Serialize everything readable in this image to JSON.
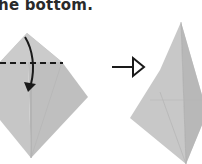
{
  "caption": "he bottom.",
  "colors": {
    "paper": "#c4c4c4",
    "paper_light": "#d2d2d2",
    "paper_dark": "#b2b2b2",
    "crease": "#a6a6a6",
    "ink": "#1a1a1a"
  },
  "steps": [
    {
      "label": "fold-step-before",
      "instruction": "fold down along dashed line"
    },
    {
      "label": "fold-step-after",
      "instruction": "result"
    }
  ]
}
